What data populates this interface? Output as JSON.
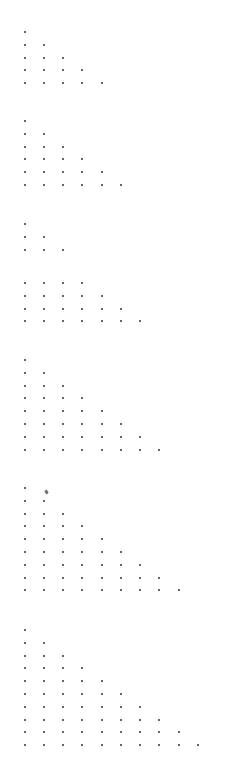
{
  "canvas": {
    "width": 250,
    "height": 761,
    "background": "#ffffff",
    "dot_color": "#333333",
    "dot_size": 2,
    "x_start": 24.5,
    "x_step": 19.25,
    "y_step": 12.8
  },
  "triangles": [
    {
      "id": 1,
      "y_start": 32,
      "rows": [
        1,
        2,
        3,
        4,
        5
      ]
    },
    {
      "id": 2,
      "y_start": 121,
      "rows": [
        1,
        2,
        3,
        4,
        5,
        6
      ]
    },
    {
      "id": 3,
      "y_start": 224,
      "rows": [
        1,
        2,
        3
      ]
    },
    {
      "id": 4,
      "y_start": 283,
      "rows": [
        4,
        5,
        6,
        7
      ]
    },
    {
      "id": 5,
      "y_start": 360,
      "rows": [
        1,
        2,
        3,
        4,
        5,
        6,
        7,
        8
      ]
    },
    {
      "id": 6,
      "y_start": 488,
      "rows": [
        1,
        2,
        3,
        4,
        5,
        6,
        7,
        8,
        9
      ]
    },
    {
      "id": 7,
      "y_start": 630,
      "rows": [
        1,
        2,
        3,
        4,
        5,
        6,
        7,
        8,
        9,
        10
      ]
    }
  ],
  "marks": [
    {
      "name": "smudge-mark",
      "x": 45,
      "y": 490,
      "color": "#555555"
    }
  ]
}
